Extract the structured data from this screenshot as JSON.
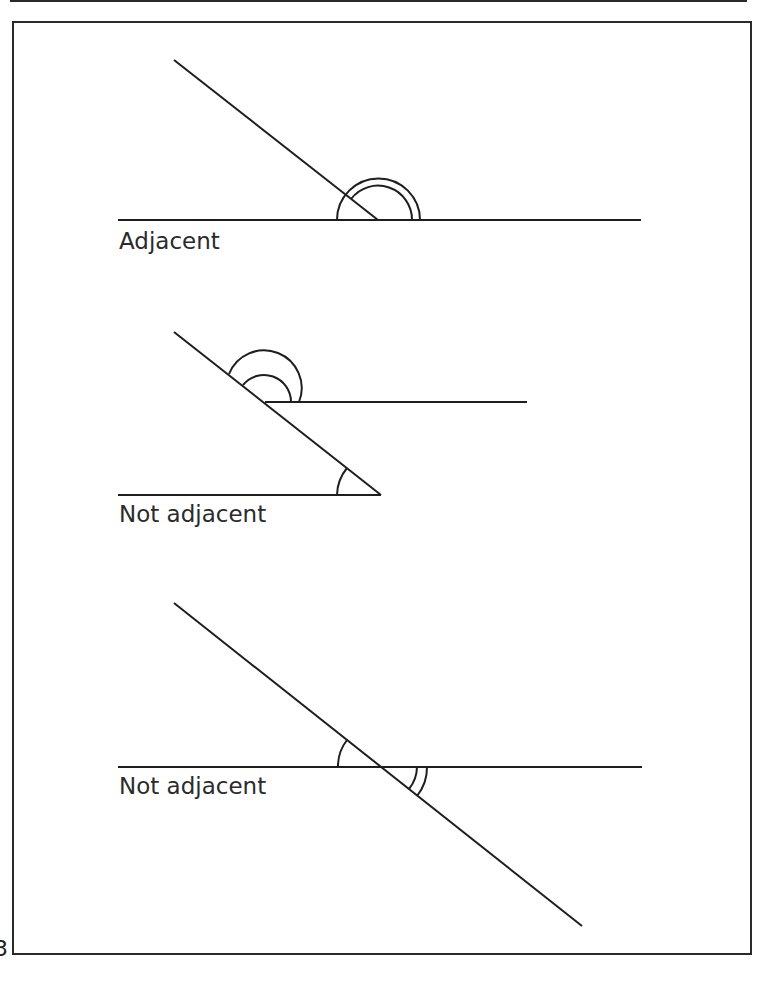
{
  "page": {
    "number_fragment": "3"
  },
  "diagrams": [
    {
      "label": "Adjacent",
      "lines": [
        {
          "x1": 174,
          "y1": 60,
          "x2": 378,
          "y2": 220
        },
        {
          "x1": 118,
          "y1": 220,
          "x2": 641,
          "y2": 220
        }
      ]
    },
    {
      "label": "Not adjacent",
      "lines": [
        {
          "x1": 174,
          "y1": 332,
          "x2": 381,
          "y2": 495
        },
        {
          "x1": 265,
          "y1": 402,
          "x2": 527,
          "y2": 402
        },
        {
          "x1": 118,
          "y1": 495,
          "x2": 381,
          "y2": 495
        }
      ]
    },
    {
      "label": "Not adjacent",
      "lines": [
        {
          "x1": 174,
          "y1": 603,
          "x2": 582,
          "y2": 926
        },
        {
          "x1": 118,
          "y1": 767,
          "x2": 642,
          "y2": 767
        }
      ]
    }
  ],
  "colors": {
    "stroke": "#1e1e1e",
    "text": "#2b2b2b"
  }
}
